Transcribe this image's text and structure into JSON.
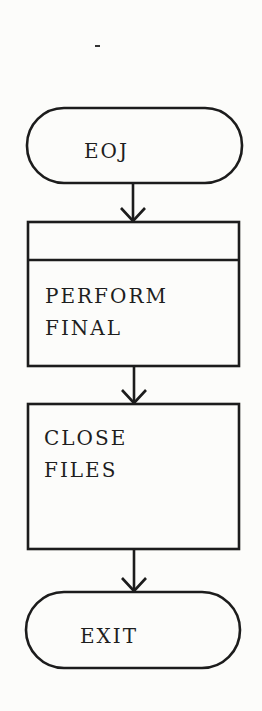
{
  "diagram": {
    "type": "flowchart",
    "nodes": [
      {
        "id": "eoj",
        "shape": "terminator",
        "label": "EOJ"
      },
      {
        "id": "perform-final",
        "shape": "predefined-process",
        "lines": [
          "PERFORM",
          "FINAL"
        ]
      },
      {
        "id": "close-files",
        "shape": "process",
        "lines": [
          "CLOSE",
          "FILES"
        ]
      },
      {
        "id": "exit",
        "shape": "terminator",
        "label": "EXIT"
      }
    ],
    "edges": [
      {
        "from": "eoj",
        "to": "perform-final"
      },
      {
        "from": "perform-final",
        "to": "close-files"
      },
      {
        "from": "close-files",
        "to": "exit"
      }
    ],
    "colors": {
      "line": "#1c1c1c",
      "background": "#fcfcfa"
    }
  }
}
